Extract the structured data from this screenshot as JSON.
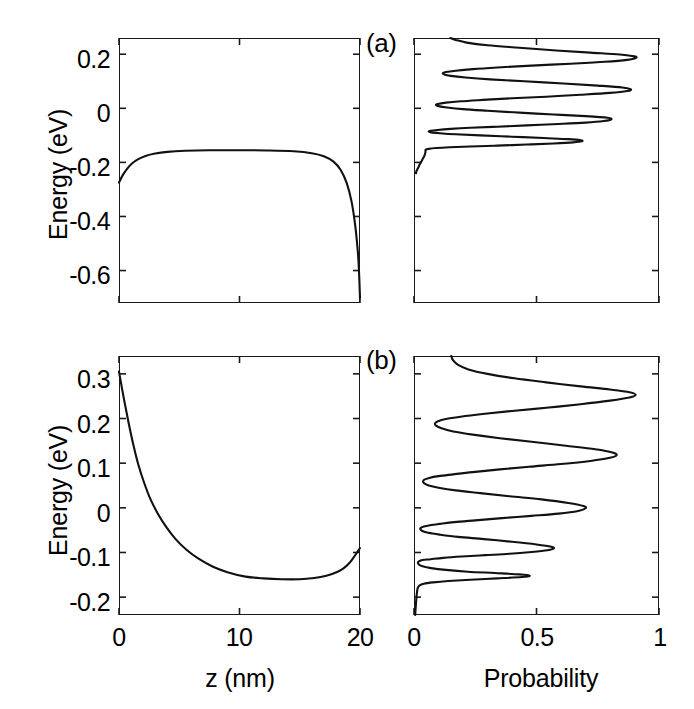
{
  "figure": {
    "width": 694,
    "height": 709,
    "background": "#ffffff",
    "line_color": "#111111",
    "axis_color": "#1a1a1a"
  },
  "panel_labels": {
    "a": "(a)",
    "b": "(b)"
  },
  "axis_titles": {
    "energy": "Energy (eV)",
    "z": "z (nm)",
    "probability": "Probability"
  },
  "chart_data": [
    {
      "id": "panel-a-potential",
      "type": "line",
      "title": "(a) conduction band edge profile",
      "xlabel": "z (nm)",
      "ylabel": "Energy (eV)",
      "xlim": [
        0,
        20
      ],
      "ylim": [
        -0.72,
        0.26
      ],
      "xticks": [
        0,
        10,
        20
      ],
      "xticklabels": [
        "",
        "",
        ""
      ],
      "yticks": [
        0.2,
        0,
        -0.2,
        -0.4,
        -0.6
      ],
      "yticklabels": [
        "0.2",
        "0",
        "-0.2",
        "-0.4",
        "-0.6"
      ],
      "grid": false,
      "legend": "none",
      "series": [
        {
          "name": "potential",
          "x": [
            0,
            0.3,
            0.7,
            1.1,
            1.6,
            2.2,
            3.0,
            4.0,
            5.5,
            7.5,
            10,
            12.5,
            14.5,
            16.0,
            17.0,
            17.8,
            18.4,
            18.9,
            19.3,
            19.6,
            19.8,
            19.9,
            20
          ],
          "y": [
            -0.275,
            -0.248,
            -0.222,
            -0.203,
            -0.188,
            -0.176,
            -0.167,
            -0.161,
            -0.157,
            -0.155,
            -0.155,
            -0.156,
            -0.159,
            -0.166,
            -0.177,
            -0.197,
            -0.228,
            -0.277,
            -0.345,
            -0.432,
            -0.52,
            -0.585,
            -0.7
          ]
        }
      ]
    },
    {
      "id": "panel-a-probability",
      "type": "line",
      "title": "(a) probability density vs energy",
      "xlabel": "Probability",
      "ylabel": "Energy (eV)",
      "xlim": [
        0,
        1
      ],
      "ylim": [
        -0.72,
        0.26
      ],
      "xticks": [
        0,
        0.5,
        1
      ],
      "xticklabels": [
        "",
        "",
        ""
      ],
      "yticks": [
        0.2,
        0,
        -0.2,
        -0.4,
        -0.6
      ],
      "grid": false,
      "legend": "none",
      "peaks": [
        {
          "energy": 0.255,
          "probability": 0.145
        },
        {
          "energy": 0.195,
          "probability": 0.905
        },
        {
          "energy": 0.135,
          "probability": 0.118
        },
        {
          "energy": 0.068,
          "probability": 0.885
        },
        {
          "energy": 0.012,
          "probability": 0.09
        },
        {
          "energy": -0.04,
          "probability": 0.805
        },
        {
          "energy": -0.072,
          "probability": 0.06
        },
        {
          "energy": -0.1,
          "probability": 0.685
        },
        {
          "energy": -0.135,
          "probability": 0.03
        },
        {
          "energy": -0.175,
          "probability": 0.01
        }
      ],
      "series": [
        {
          "name": "probability",
          "points": [
            [
              0.148,
              0.26
            ],
            [
              0.17,
              0.253
            ],
            [
              0.215,
              0.243
            ],
            [
              0.3,
              0.233
            ],
            [
              0.43,
              0.224
            ],
            [
              0.58,
              0.214
            ],
            [
              0.72,
              0.206
            ],
            [
              0.84,
              0.199
            ],
            [
              0.9,
              0.192
            ],
            [
              0.905,
              0.186
            ],
            [
              0.87,
              0.179
            ],
            [
              0.78,
              0.172
            ],
            [
              0.64,
              0.165
            ],
            [
              0.48,
              0.158
            ],
            [
              0.34,
              0.151
            ],
            [
              0.24,
              0.145
            ],
            [
              0.17,
              0.139
            ],
            [
              0.13,
              0.134
            ],
            [
              0.118,
              0.13
            ],
            [
              0.124,
              0.125
            ],
            [
              0.15,
              0.12
            ],
            [
              0.21,
              0.114
            ],
            [
              0.31,
              0.107
            ],
            [
              0.45,
              0.1
            ],
            [
              0.61,
              0.092
            ],
            [
              0.75,
              0.084
            ],
            [
              0.85,
              0.077
            ],
            [
              0.885,
              0.07
            ],
            [
              0.87,
              0.064
            ],
            [
              0.8,
              0.057
            ],
            [
              0.68,
              0.05
            ],
            [
              0.54,
              0.043
            ],
            [
              0.4,
              0.037
            ],
            [
              0.28,
              0.031
            ],
            [
              0.19,
              0.026
            ],
            [
              0.13,
              0.021
            ],
            [
              0.097,
              0.016
            ],
            [
              0.09,
              0.012
            ],
            [
              0.1,
              0.008
            ],
            [
              0.135,
              0.003
            ],
            [
              0.2,
              -0.003
            ],
            [
              0.3,
              -0.009
            ],
            [
              0.43,
              -0.016
            ],
            [
              0.57,
              -0.023
            ],
            [
              0.7,
              -0.029
            ],
            [
              0.79,
              -0.035
            ],
            [
              0.805,
              -0.041
            ],
            [
              0.775,
              -0.047
            ],
            [
              0.7,
              -0.053
            ],
            [
              0.59,
              -0.058
            ],
            [
              0.46,
              -0.063
            ],
            [
              0.34,
              -0.068
            ],
            [
              0.23,
              -0.072
            ],
            [
              0.15,
              -0.076
            ],
            [
              0.095,
              -0.08
            ],
            [
              0.068,
              -0.083
            ],
            [
              0.06,
              -0.086
            ],
            [
              0.07,
              -0.089
            ],
            [
              0.105,
              -0.092
            ],
            [
              0.17,
              -0.096
            ],
            [
              0.27,
              -0.1
            ],
            [
              0.4,
              -0.105
            ],
            [
              0.53,
              -0.11
            ],
            [
              0.63,
              -0.114
            ],
            [
              0.68,
              -0.118
            ],
            [
              0.685,
              -0.122
            ],
            [
              0.65,
              -0.126
            ],
            [
              0.57,
              -0.13
            ],
            [
              0.46,
              -0.134
            ],
            [
              0.34,
              -0.138
            ],
            [
              0.23,
              -0.141
            ],
            [
              0.145,
              -0.144
            ],
            [
              0.09,
              -0.147
            ],
            [
              0.06,
              -0.15
            ],
            [
              0.048,
              -0.153
            ],
            [
              0.047,
              -0.158
            ],
            [
              0.046,
              -0.165
            ],
            [
              0.044,
              -0.172
            ],
            [
              0.04,
              -0.18
            ],
            [
              0.034,
              -0.19
            ],
            [
              0.028,
              -0.2
            ],
            [
              0.022,
              -0.21
            ],
            [
              0.016,
              -0.222
            ],
            [
              0.01,
              -0.232
            ],
            [
              0.008,
              -0.24
            ]
          ]
        }
      ]
    },
    {
      "id": "panel-b-potential",
      "type": "line",
      "title": "(b) conduction band edge profile",
      "xlabel": "z (nm)",
      "ylabel": "Energy (eV)",
      "xlim": [
        0,
        20
      ],
      "ylim": [
        -0.24,
        0.34
      ],
      "xticks": [
        0,
        10,
        20
      ],
      "xticklabels": [
        "0",
        "10",
        "20"
      ],
      "yticks": [
        0.3,
        0.2,
        0.1,
        0,
        -0.1,
        -0.2
      ],
      "yticklabels": [
        "0.3",
        "0.2",
        "0.1",
        "0",
        "-0.1",
        "-0.2"
      ],
      "grid": false,
      "legend": "none",
      "series": [
        {
          "name": "potential",
          "x": [
            0,
            0.4,
            0.8,
            1.2,
            1.6,
            2.1,
            2.6,
            3.2,
            3.9,
            4.7,
            5.6,
            6.6,
            7.8,
            9.0,
            10.5,
            12.0,
            13.5,
            15.0,
            16.2,
            17.2,
            18.0,
            18.6,
            19.1,
            19.5,
            19.8,
            20
          ],
          "y": [
            0.305,
            0.245,
            0.19,
            0.14,
            0.097,
            0.055,
            0.02,
            -0.012,
            -0.042,
            -0.07,
            -0.094,
            -0.114,
            -0.132,
            -0.144,
            -0.154,
            -0.158,
            -0.16,
            -0.16,
            -0.157,
            -0.152,
            -0.145,
            -0.136,
            -0.124,
            -0.11,
            -0.098,
            -0.09
          ]
        }
      ]
    },
    {
      "id": "panel-b-probability",
      "type": "line",
      "title": "(b) probability density vs energy",
      "xlabel": "Probability",
      "ylabel": "Energy (eV)",
      "xlim": [
        0,
        1
      ],
      "ylim": [
        -0.24,
        0.34
      ],
      "xticks": [
        0,
        0.5,
        1
      ],
      "xticklabels": [
        "0",
        "0.5",
        "1"
      ],
      "yticks": [
        0.3,
        0.2,
        0.1,
        0,
        -0.1,
        -0.2
      ],
      "grid": false,
      "legend": "none",
      "peaks": [
        {
          "energy": 0.33,
          "probability": 0.15
        },
        {
          "energy": 0.258,
          "probability": 0.905
        },
        {
          "energy": 0.196,
          "probability": 0.085
        },
        {
          "energy": 0.118,
          "probability": 0.825
        },
        {
          "energy": 0.062,
          "probability": 0.035
        },
        {
          "energy": 0.0,
          "probability": 0.7
        },
        {
          "energy": -0.042,
          "probability": 0.02
        },
        {
          "energy": -0.088,
          "probability": 0.57
        },
        {
          "energy": -0.112,
          "probability": 0.012
        },
        {
          "energy": -0.148,
          "probability": 0.475
        }
      ],
      "series": [
        {
          "name": "probability",
          "points": [
            [
              0.152,
              0.34
            ],
            [
              0.16,
              0.33
            ],
            [
              0.18,
              0.32
            ],
            [
              0.222,
              0.31
            ],
            [
              0.3,
              0.3
            ],
            [
              0.41,
              0.29
            ],
            [
              0.54,
              0.281
            ],
            [
              0.68,
              0.272
            ],
            [
              0.8,
              0.265
            ],
            [
              0.88,
              0.259
            ],
            [
              0.905,
              0.253
            ],
            [
              0.88,
              0.247
            ],
            [
              0.8,
              0.24
            ],
            [
              0.68,
              0.232
            ],
            [
              0.54,
              0.224
            ],
            [
              0.4,
              0.217
            ],
            [
              0.28,
              0.21
            ],
            [
              0.19,
              0.204
            ],
            [
              0.13,
              0.199
            ],
            [
              0.098,
              0.194
            ],
            [
              0.086,
              0.189
            ],
            [
              0.09,
              0.184
            ],
            [
              0.112,
              0.178
            ],
            [
              0.16,
              0.171
            ],
            [
              0.24,
              0.164
            ],
            [
              0.35,
              0.156
            ],
            [
              0.48,
              0.148
            ],
            [
              0.62,
              0.139
            ],
            [
              0.74,
              0.131
            ],
            [
              0.81,
              0.124
            ],
            [
              0.827,
              0.118
            ],
            [
              0.8,
              0.112
            ],
            [
              0.72,
              0.105
            ],
            [
              0.6,
              0.098
            ],
            [
              0.47,
              0.092
            ],
            [
              0.35,
              0.086
            ],
            [
              0.24,
              0.08
            ],
            [
              0.16,
              0.075
            ],
            [
              0.1,
              0.071
            ],
            [
              0.062,
              0.067
            ],
            [
              0.042,
              0.063
            ],
            [
              0.037,
              0.059
            ],
            [
              0.042,
              0.055
            ],
            [
              0.06,
              0.05
            ],
            [
              0.1,
              0.045
            ],
            [
              0.17,
              0.039
            ],
            [
              0.27,
              0.033
            ],
            [
              0.39,
              0.026
            ],
            [
              0.52,
              0.019
            ],
            [
              0.63,
              0.011
            ],
            [
              0.692,
              0.004
            ],
            [
              0.7,
              -0.001
            ],
            [
              0.67,
              -0.007
            ],
            [
              0.59,
              -0.013
            ],
            [
              0.48,
              -0.018
            ],
            [
              0.36,
              -0.023
            ],
            [
              0.25,
              -0.028
            ],
            [
              0.165,
              -0.032
            ],
            [
              0.105,
              -0.036
            ],
            [
              0.065,
              -0.039
            ],
            [
              0.04,
              -0.042
            ],
            [
              0.028,
              -0.045
            ],
            [
              0.026,
              -0.048
            ],
            [
              0.034,
              -0.052
            ],
            [
              0.058,
              -0.056
            ],
            [
              0.105,
              -0.06
            ],
            [
              0.18,
              -0.065
            ],
            [
              0.285,
              -0.07
            ],
            [
              0.4,
              -0.076
            ],
            [
              0.5,
              -0.082
            ],
            [
              0.56,
              -0.087
            ],
            [
              0.57,
              -0.091
            ],
            [
              0.545,
              -0.095
            ],
            [
              0.48,
              -0.099
            ],
            [
              0.39,
              -0.103
            ],
            [
              0.29,
              -0.106
            ],
            [
              0.195,
              -0.109
            ],
            [
              0.12,
              -0.112
            ],
            [
              0.068,
              -0.115
            ],
            [
              0.035,
              -0.117
            ],
            [
              0.02,
              -0.12
            ],
            [
              0.016,
              -0.123
            ],
            [
              0.02,
              -0.127
            ],
            [
              0.035,
              -0.131
            ],
            [
              0.07,
              -0.135
            ],
            [
              0.13,
              -0.139
            ],
            [
              0.22,
              -0.143
            ],
            [
              0.33,
              -0.146
            ],
            [
              0.43,
              -0.149
            ],
            [
              0.472,
              -0.152
            ],
            [
              0.44,
              -0.155
            ],
            [
              0.34,
              -0.158
            ],
            [
              0.23,
              -0.161
            ],
            [
              0.14,
              -0.164
            ],
            [
              0.078,
              -0.167
            ],
            [
              0.04,
              -0.17
            ],
            [
              0.022,
              -0.174
            ],
            [
              0.015,
              -0.18
            ],
            [
              0.012,
              -0.19
            ],
            [
              0.01,
              -0.2
            ],
            [
              0.008,
              -0.215
            ],
            [
              0.006,
              -0.23
            ],
            [
              0.005,
              -0.24
            ]
          ]
        }
      ]
    }
  ]
}
